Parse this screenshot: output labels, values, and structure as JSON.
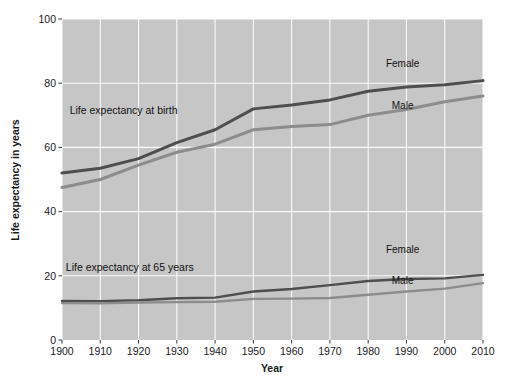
{
  "chart_data": {
    "type": "line",
    "title": "",
    "xlabel": "Year",
    "ylabel": "Life expectancy in years",
    "xlim": [
      1900,
      2010
    ],
    "ylim": [
      0,
      100
    ],
    "grid": true,
    "legend_position": "inline-labels",
    "plot_bgcolor": "#c6c6c6",
    "gridcolor": "#ffffff",
    "xticks": [
      "1900",
      "1910",
      "1920",
      "1930",
      "1940",
      "1950",
      "1960",
      "1970",
      "1980",
      "1990",
      "2000",
      "2010"
    ],
    "yticks": [
      "0",
      "20",
      "40",
      "60",
      "80",
      "100"
    ],
    "x": [
      1900,
      1910,
      1920,
      1930,
      1940,
      1950,
      1960,
      1970,
      1980,
      1990,
      2000,
      2010
    ],
    "annotations": [
      {
        "text": "Life expectancy at birth",
        "x": 1902,
        "y": 70.5
      },
      {
        "text": "Life expectancy at 65 years",
        "x": 1901,
        "y": 21.5
      }
    ],
    "series": [
      {
        "name": "Female",
        "group": "at birth",
        "color": "#4e4e4e",
        "width": 3.0,
        "label": "Female",
        "label_x": 1989,
        "label_y": 85.0,
        "values": [
          52.0,
          53.5,
          56.5,
          61.5,
          65.5,
          72.0,
          73.2,
          74.8,
          77.5,
          78.8,
          79.5,
          80.8
        ]
      },
      {
        "name": "Male",
        "group": "at birth",
        "color": "#8c8c8c",
        "width": 3.0,
        "label": "Male",
        "label_x": 1989,
        "label_y": 72.0,
        "values": [
          47.5,
          50.0,
          54.5,
          58.5,
          61.0,
          65.5,
          66.5,
          67.1,
          70.0,
          71.8,
          74.2,
          76.0
        ]
      },
      {
        "name": "Female",
        "group": "at 65 years",
        "color": "#4e4e4e",
        "width": 2.4,
        "label": "Female",
        "label_x": 1989,
        "label_y": 27.0,
        "values": [
          12.2,
          12.1,
          12.4,
          13.0,
          13.2,
          15.1,
          15.9,
          17.1,
          18.4,
          19.0,
          19.2,
          20.3
        ]
      },
      {
        "name": "Male",
        "group": "at 65 years",
        "color": "#8c8c8c",
        "width": 2.4,
        "label": "Male",
        "label_x": 1989,
        "label_y": 17.5,
        "values": [
          11.5,
          11.4,
          11.7,
          11.8,
          11.9,
          12.8,
          12.9,
          13.1,
          14.1,
          15.1,
          16.0,
          17.7
        ]
      }
    ]
  }
}
